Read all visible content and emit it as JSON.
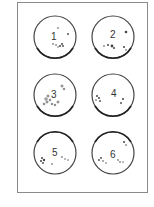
{
  "figure": {
    "dishes": [
      {
        "label": "1",
        "cx": 55,
        "cy": 37
      },
      {
        "label": "2",
        "cx": 113,
        "cy": 37
      },
      {
        "label": "3",
        "cx": 55,
        "cy": 95
      },
      {
        "label": "4",
        "cx": 113,
        "cy": 95
      },
      {
        "label": "5",
        "cx": 55,
        "cy": 153
      },
      {
        "label": "6",
        "cx": 113,
        "cy": 153
      }
    ],
    "colors": {
      "rim": "#333333",
      "frame": "#8a8a8a",
      "colony": "#444444"
    }
  }
}
